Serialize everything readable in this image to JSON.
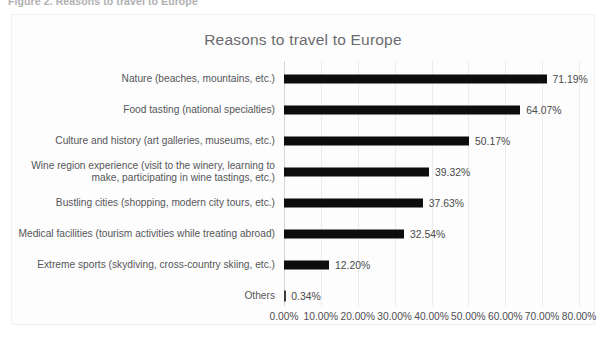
{
  "figure": {
    "caption": "Figure 2. Reasons to travel to Europe"
  },
  "chart_data": {
    "type": "bar",
    "orientation": "horizontal",
    "title": "Reasons to travel to Europe",
    "xlabel": "",
    "ylabel": "",
    "xlim": [
      0,
      80
    ],
    "xticks": [
      0,
      10,
      20,
      30,
      40,
      50,
      60,
      70,
      80
    ],
    "xtick_labels": [
      "0.00%",
      "10.00%",
      "20.00%",
      "30.00%",
      "40.00%",
      "50.00%",
      "60.00%",
      "70.00%",
      "80.00%"
    ],
    "grid": true,
    "legend": "none",
    "bar_color": "#0d0d0d",
    "categories": [
      "Nature (beaches, mountains, etc.)",
      "Food tasting (national specialties)",
      "Culture and history (art galleries, museums, etc.)",
      "Wine region experience (visit to the winery, learning to\nmake, participating in wine tastings, etc.)",
      "Bustling cities (shopping, modern city tours, etc.)",
      "Medical facilities (tourism activities while treating abroad)",
      "Extreme sports (skydiving, cross-country skiing, etc.)",
      "Others"
    ],
    "values": [
      71.19,
      64.07,
      50.17,
      39.32,
      37.63,
      32.54,
      12.2,
      0.34
    ],
    "data_labels": [
      "71.19%",
      "64.07%",
      "50.17%",
      "39.32%",
      "37.63%",
      "32.54%",
      "12.20%",
      "0.34%"
    ]
  }
}
